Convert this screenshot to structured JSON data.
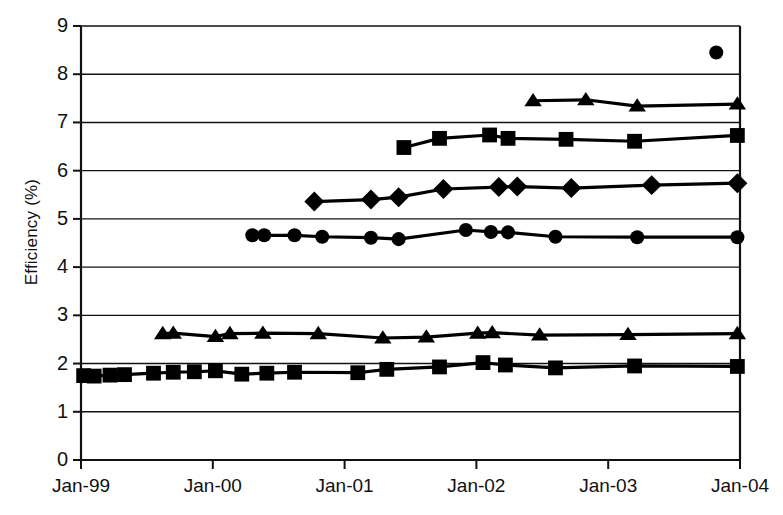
{
  "chart_data": {
    "type": "line",
    "title": "",
    "xlabel": "",
    "ylabel": "Efficiency (%)",
    "ylim": [
      0,
      9
    ],
    "ytick_labels": [
      "9",
      "8",
      "7",
      "6",
      "5",
      "4",
      "3",
      "2",
      "1",
      "0"
    ],
    "ytick_values": [
      9,
      8,
      7,
      6,
      5,
      4,
      3,
      2,
      1,
      0
    ],
    "xtick_labels": [
      "Jan-99",
      "Jan-00",
      "Jan-01",
      "Jan-02",
      "Jan-03",
      "Jan-04"
    ],
    "xtick_values": [
      1999.0,
      2000.0,
      2001.0,
      2002.0,
      2003.0,
      2004.0
    ],
    "xlim": [
      1999.0,
      2004.0
    ],
    "grid": "horizontal",
    "legend": "none",
    "marker_color": "#000000",
    "line_color": "#000000",
    "series": [
      {
        "name": "Series 1 - top triangle",
        "marker": "triangle",
        "x": [
          2002.43,
          2002.83,
          2003.22,
          2003.98
        ],
        "values": [
          7.45,
          7.47,
          7.34,
          7.38
        ]
      },
      {
        "name": "Series 2 - upper square",
        "marker": "square",
        "x": [
          2001.45,
          2001.72,
          2002.1,
          2002.24,
          2002.68,
          2003.2,
          2003.98
        ],
        "values": [
          6.48,
          6.67,
          6.74,
          6.67,
          6.65,
          6.61,
          6.73
        ]
      },
      {
        "name": "Series 3 - diamond",
        "marker": "diamond",
        "x": [
          2000.77,
          2001.2,
          2001.41,
          2001.75,
          2002.17,
          2002.31,
          2002.72,
          2003.33,
          2003.98
        ],
        "values": [
          5.36,
          5.4,
          5.45,
          5.62,
          5.66,
          5.67,
          5.64,
          5.7,
          5.74
        ]
      },
      {
        "name": "Series 4 - circle",
        "marker": "circle",
        "x": [
          2000.3,
          2000.39,
          2000.62,
          2000.83,
          2001.2,
          2001.41,
          2001.92,
          2002.11,
          2002.24,
          2002.6,
          2003.22,
          2003.98
        ],
        "values": [
          4.66,
          4.66,
          4.66,
          4.63,
          4.61,
          4.58,
          4.77,
          4.73,
          4.72,
          4.63,
          4.62,
          4.62
        ]
      },
      {
        "name": "Series 5 - lower triangle",
        "marker": "triangle",
        "x": [
          1999.62,
          1999.7,
          2000.02,
          2000.13,
          2000.38,
          2000.8,
          2001.29,
          2001.62,
          2002.01,
          2002.12,
          2002.48,
          2003.15,
          2003.98
        ],
        "values": [
          2.62,
          2.63,
          2.56,
          2.62,
          2.63,
          2.62,
          2.53,
          2.55,
          2.63,
          2.64,
          2.59,
          2.6,
          2.62
        ]
      },
      {
        "name": "Series 6 - lower square",
        "marker": "square",
        "x": [
          1999.02,
          1999.1,
          1999.22,
          1999.33,
          1999.55,
          1999.7,
          1999.86,
          2000.02,
          2000.22,
          2000.41,
          2000.62,
          2001.1,
          2001.32,
          2001.72,
          2002.05,
          2002.22,
          2002.6,
          2003.2,
          2003.98
        ],
        "values": [
          1.75,
          1.74,
          1.76,
          1.77,
          1.8,
          1.82,
          1.83,
          1.85,
          1.78,
          1.8,
          1.82,
          1.81,
          1.88,
          1.93,
          2.02,
          1.97,
          1.91,
          1.95,
          1.94
        ]
      },
      {
        "name": "Series 7 - isolated circle point",
        "marker": "circle",
        "x": [
          2003.82
        ],
        "values": [
          8.45
        ]
      }
    ]
  },
  "axes": {
    "y_title": "Efficiency (%)"
  }
}
